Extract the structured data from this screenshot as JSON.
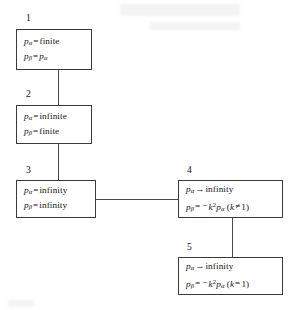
{
  "diagram": {
    "type": "flowchart",
    "title": "",
    "nodes": [
      {
        "id": "1",
        "label": "1",
        "line1": {
          "lhs_var": "p",
          "lhs_sub": "α",
          "operator": "=",
          "rhs": "finite"
        },
        "line2": {
          "lhs_var": "p",
          "lhs_sub": "β",
          "operator": "=",
          "rhs_var": "p",
          "rhs_sub": "α"
        },
        "line1_text": "pα = finite",
        "line2_text": "pβ = pα"
      },
      {
        "id": "2",
        "label": "2",
        "line1_text": "pα = infinite",
        "line2_text": "pβ = finite",
        "line1": {
          "lhs_var": "p",
          "lhs_sub": "α",
          "operator": "=",
          "rhs": "infinite"
        },
        "line2": {
          "lhs_var": "p",
          "lhs_sub": "β",
          "operator": "=",
          "rhs": "finite"
        }
      },
      {
        "id": "3",
        "label": "3",
        "line1_text": "pα = infinity",
        "line2_text": "pβ = infinity",
        "line1": {
          "lhs_var": "p",
          "lhs_sub": "α",
          "operator": "=",
          "rhs": "infinity"
        },
        "line2": {
          "lhs_var": "p",
          "lhs_sub": "β",
          "operator": "=",
          "rhs": "infinity"
        }
      },
      {
        "id": "4",
        "label": "4",
        "line1_text": "pα → infinity",
        "line2_text": "pβ = −k²pα (k ≠ 1)",
        "line1": {
          "lhs_var": "p",
          "lhs_sub": "α",
          "operator": "→",
          "rhs": "infinity"
        },
        "line2": {
          "lhs_var": "p",
          "lhs_sub": "β",
          "operator": "=",
          "minus": "−",
          "coef_var": "k",
          "coef_sup": "2",
          "rhs_var": "p",
          "rhs_sub": "α",
          "cond_open": "(",
          "cond_var": "k",
          "cond_op": "≠",
          "cond_val": "1",
          "cond_close": ")"
        }
      },
      {
        "id": "5",
        "label": "5",
        "line1_text": "pα → infinity",
        "line2_text": "pβ = −k²pα (k = 1)",
        "line1": {
          "lhs_var": "p",
          "lhs_sub": "α",
          "operator": "→",
          "rhs": "infinity"
        },
        "line2": {
          "lhs_var": "p",
          "lhs_sub": "β",
          "operator": "=",
          "minus": "−",
          "coef_var": "k",
          "coef_sup": "2",
          "rhs_var": "p",
          "rhs_sub": "α",
          "cond_open": "(",
          "cond_var": "k",
          "cond_op": "=",
          "cond_val": "1",
          "cond_close": ")"
        }
      }
    ],
    "edges": [
      {
        "from": "1",
        "to": "2",
        "orientation": "vertical"
      },
      {
        "from": "2",
        "to": "3",
        "orientation": "vertical"
      },
      {
        "from": "3",
        "to": "4",
        "orientation": "horizontal"
      },
      {
        "from": "4",
        "to": "5",
        "orientation": "vertical"
      }
    ],
    "colors": {
      "box_border": "#3a3a3a",
      "connector": "#4a4a4a",
      "text": "#131313",
      "background": "#ffffff"
    }
  }
}
